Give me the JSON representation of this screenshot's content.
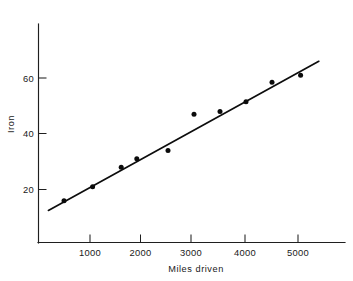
{
  "chart_data": {
    "type": "scatter",
    "title": "",
    "xlabel": "Miles  driven",
    "ylabel": "Iron",
    "xlim": [
      0,
      5800
    ],
    "ylim": [
      0,
      72
    ],
    "grid": false,
    "legend": null,
    "xticks": [
      1000,
      2000,
      3000,
      4000,
      5000
    ],
    "xtick_labels": [
      "1000",
      "2000",
      "3000",
      "4000",
      "5000"
    ],
    "yticks": [
      20,
      40,
      60
    ],
    "ytick_labels": [
      "20",
      "40",
      "60"
    ],
    "point_color": "#0b0b0b",
    "line_color": "#0d0d0d",
    "axis_color": "#1f1f1f",
    "x": [
      500,
      1050,
      1600,
      1900,
      2500,
      3000,
      3500,
      4000,
      4500,
      5050
    ],
    "y": [
      16,
      21,
      28,
      31,
      34,
      47,
      48,
      51.5,
      58.5,
      61
    ],
    "points": [
      {
        "x": 500,
        "y": 16
      },
      {
        "x": 1050,
        "y": 21
      },
      {
        "x": 1600,
        "y": 28
      },
      {
        "x": 1900,
        "y": 31
      },
      {
        "x": 2500,
        "y": 34
      },
      {
        "x": 3000,
        "y": 47
      },
      {
        "x": 3500,
        "y": 48
      },
      {
        "x": 4000,
        "y": 51.5
      },
      {
        "x": 4500,
        "y": 58.5
      },
      {
        "x": 5050,
        "y": 61
      }
    ],
    "series": [
      {
        "name": "Iron content",
        "type": "scatter",
        "values": [
          16,
          21,
          28,
          31,
          34,
          47,
          48,
          51.5,
          58.5,
          61
        ]
      },
      {
        "name": "Fitted regression line",
        "type": "line",
        "x_endpoints": [
          200,
          5400
        ],
        "y_endpoints": [
          12.5,
          66
        ]
      }
    ],
    "fit_line": {
      "x_start": 200,
      "y_start": 12.5,
      "x_end": 5400,
      "y_end": 66
    }
  }
}
